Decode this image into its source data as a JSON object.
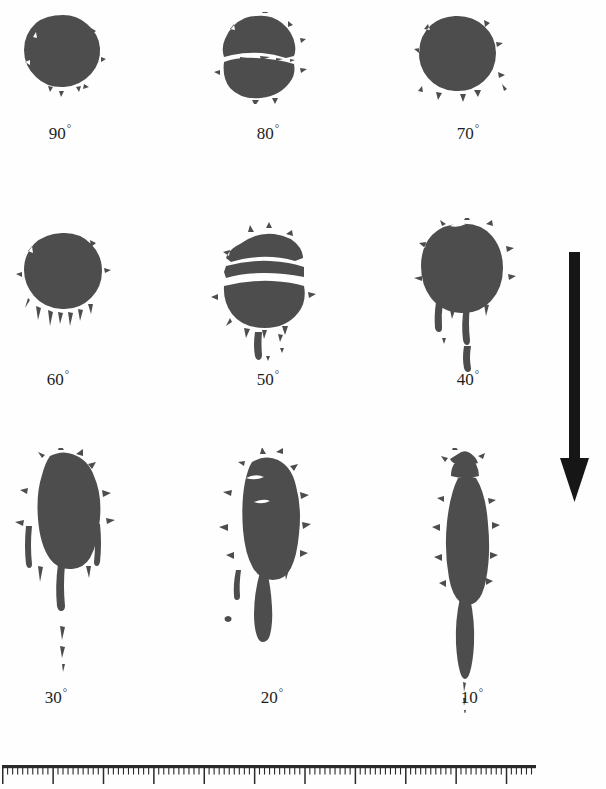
{
  "figure": {
    "cropped_title_fragment": "g  p",
    "stain_color": "#4d4d4d",
    "ink_color": "#1d1d1d",
    "background_color": "#fefefe"
  },
  "arrow": {
    "name": "downward-direction-arrow",
    "direction": "down",
    "color": "#161616"
  },
  "ruler": {
    "name": "scale-bar-ruler",
    "color": "#2a2a2a",
    "total_minor_ticks": 106,
    "major_tick_every": 10
  },
  "chart_data": {
    "type": "table",
    "title": "",
    "xlabel": "",
    "ylabel": "",
    "rows": [
      [
        {
          "label": "90",
          "degree_symbol": "°",
          "angle": 90
        },
        {
          "label": "80",
          "degree_symbol": "°",
          "angle": 80
        },
        {
          "label": "70",
          "degree_symbol": "°",
          "angle": 70
        }
      ],
      [
        {
          "label": "60",
          "degree_symbol": "°",
          "angle": 60
        },
        {
          "label": "50",
          "degree_symbol": "°",
          "angle": 50
        },
        {
          "label": "40",
          "degree_symbol": "°",
          "angle": 40
        }
      ],
      [
        {
          "label": "30",
          "degree_symbol": "°",
          "angle": 30
        },
        {
          "label": "20",
          "degree_symbol": "°",
          "angle": 20
        },
        {
          "label": "10",
          "degree_symbol": "°",
          "angle": 10
        }
      ]
    ],
    "categories": [
      "90°",
      "80°",
      "70°",
      "60°",
      "50°",
      "40°",
      "30°",
      "20°",
      "10°"
    ],
    "values": [
      1.0,
      1.02,
      1.05,
      1.15,
      1.3,
      1.55,
      2.1,
      2.9,
      5.75
    ],
    "series": [
      {
        "name": "stain width (px)",
        "values": [
          68,
          68,
          66,
          64,
          62,
          62,
          56,
          50,
          34
        ]
      },
      {
        "name": "stain length (px)",
        "values": [
          68,
          69,
          69,
          73,
          81,
          96,
          118,
          145,
          196
        ]
      }
    ]
  }
}
